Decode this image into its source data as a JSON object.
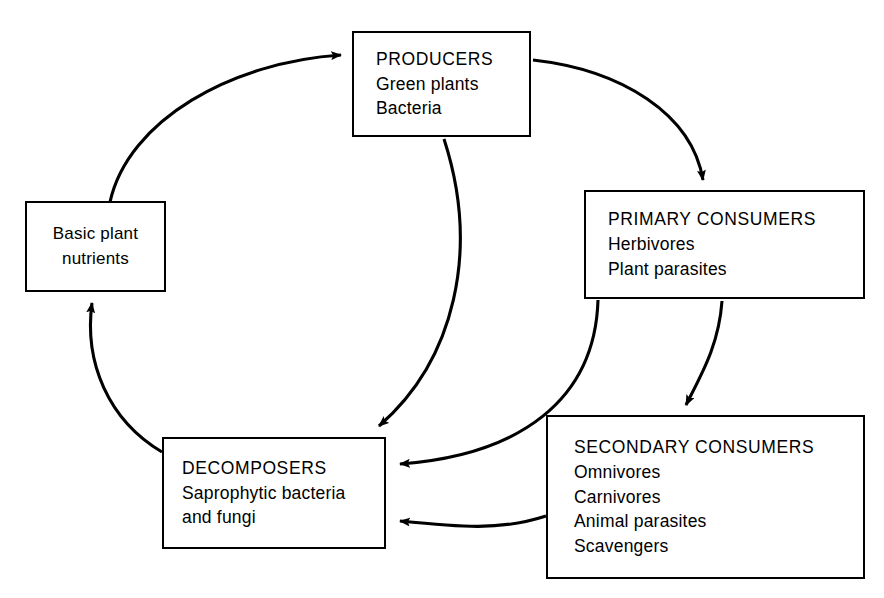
{
  "diagram": {
    "background_color": "#ffffff",
    "line_color": "#000000",
    "nodes": [
      {
        "id": "producers",
        "lines": [
          "PRODUCERS",
          "Green plants",
          "Bacteria"
        ]
      },
      {
        "id": "primary_consumers",
        "lines": [
          "PRIMARY CONSUMERS",
          "Herbivores",
          "Plant parasites"
        ]
      },
      {
        "id": "secondary_consumers",
        "lines": [
          "SECONDARY CONSUMERS",
          "Omnivores",
          "Carnivores",
          "Animal parasites",
          "Scavengers"
        ]
      },
      {
        "id": "decomposers",
        "lines": [
          "DECOMPOSERS",
          "Saprophytic bacteria",
          "and fungi"
        ]
      },
      {
        "id": "basic_plant_nutrients",
        "lines": [
          "Basic plant",
          "nutrients"
        ]
      }
    ],
    "connections": [
      {
        "from": "basic_plant_nutrients",
        "to": "producers"
      },
      {
        "from": "producers",
        "to": "primary_consumers"
      },
      {
        "from": "producers",
        "to": "decomposers"
      },
      {
        "from": "primary_consumers",
        "to": "secondary_consumers"
      },
      {
        "from": "primary_consumers",
        "to": "decomposers"
      },
      {
        "from": "secondary_consumers",
        "to": "decomposers"
      },
      {
        "from": "decomposers",
        "to": "basic_plant_nutrients"
      }
    ]
  }
}
